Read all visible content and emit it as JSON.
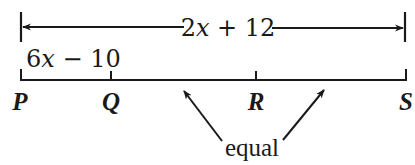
{
  "diagram": {
    "type": "number-line-segment",
    "total_length": {
      "expression_parts": [
        "2",
        "x",
        " + 12"
      ],
      "full_text": "2x + 12",
      "spans": [
        "P",
        "S"
      ]
    },
    "segment_PQ": {
      "expression_parts": [
        "6",
        "x",
        " − 10"
      ],
      "full_text": "6x − 10",
      "spans": [
        "P",
        "Q"
      ]
    },
    "points": [
      {
        "label": "P",
        "x": 21
      },
      {
        "label": "Q",
        "x": 111
      },
      {
        "label": "R",
        "x": 256
      },
      {
        "label": "S",
        "x": 406
      }
    ],
    "annotation": {
      "text": "equal",
      "refers_to": [
        "QR",
        "RS"
      ]
    },
    "colors": {
      "ink": "#1a1a1a",
      "background": "#ffffff"
    }
  }
}
